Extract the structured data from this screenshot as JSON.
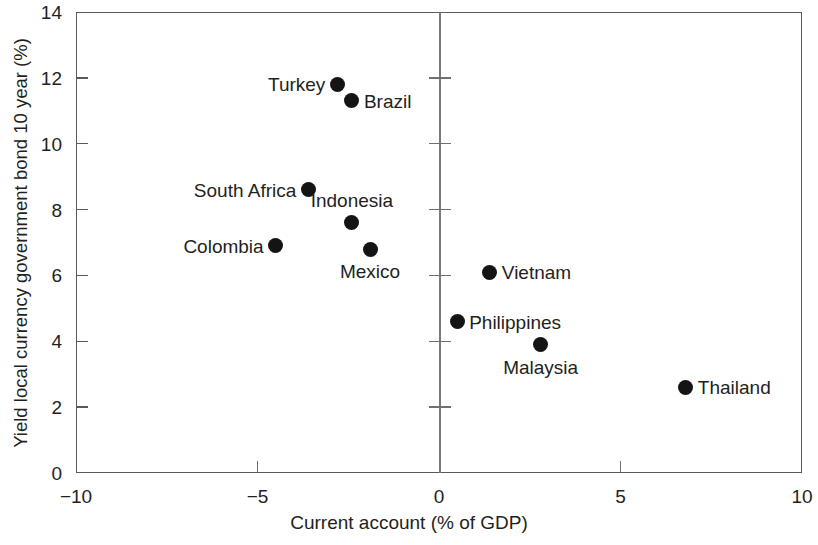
{
  "chart_data": {
    "type": "scatter",
    "title": "",
    "xlabel": "Current account (% of GDP)",
    "ylabel": "Yield local currency government bond 10 year (%)",
    "xlim": [
      -10,
      10
    ],
    "ylim": [
      0,
      14
    ],
    "xticks": [
      -10,
      -5,
      0,
      5,
      10
    ],
    "xtick_labels": [
      "−10",
      "−5",
      "0",
      "5",
      "10"
    ],
    "yticks": [
      0,
      2,
      4,
      6,
      8,
      10,
      12,
      14
    ],
    "ytick_labels": [
      "0",
      "2",
      "4",
      "6",
      "8",
      "10",
      "12",
      "14"
    ],
    "grid": false,
    "legend": "none",
    "marker_color": "#141414",
    "axis_color": "#5a5a5a",
    "zero_line_x": 0,
    "points": [
      {
        "label": "Turkey",
        "x": -2.8,
        "y": 11.8,
        "label_pos": "left"
      },
      {
        "label": "Brazil",
        "x": -2.4,
        "y": 11.3,
        "label_pos": "right"
      },
      {
        "label": "South Africa",
        "x": -3.6,
        "y": 8.6,
        "label_pos": "left"
      },
      {
        "label": "Indonesia",
        "x": -2.4,
        "y": 7.6,
        "label_pos": "above"
      },
      {
        "label": "Colombia",
        "x": -4.5,
        "y": 6.9,
        "label_pos": "left"
      },
      {
        "label": "Mexico",
        "x": -1.9,
        "y": 6.8,
        "label_pos": "below"
      },
      {
        "label": "Vietnam",
        "x": 1.4,
        "y": 6.1,
        "label_pos": "right"
      },
      {
        "label": "Philippines",
        "x": 0.5,
        "y": 4.6,
        "label_pos": "right"
      },
      {
        "label": "Malaysia",
        "x": 2.8,
        "y": 3.9,
        "label_pos": "below"
      },
      {
        "label": "Thailand",
        "x": 6.8,
        "y": 2.6,
        "label_pos": "right"
      }
    ]
  }
}
